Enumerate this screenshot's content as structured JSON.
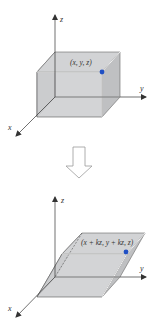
{
  "figure": {
    "top_diagram": {
      "title": "Original box",
      "axes": {
        "x_label": "x",
        "y_label": "y",
        "z_label": "z"
      },
      "point_label": "(x, y, z)",
      "point_color": "#1f4fc4"
    },
    "transition_arrow": {
      "direction": "down",
      "style": "outline"
    },
    "bottom_diagram": {
      "title": "Sheared box",
      "axes": {
        "x_label": "x",
        "y_label": "y",
        "z_label": "z"
      },
      "point_label": "(x + kz, y + kz, z)",
      "point_color": "#1f4fc4"
    },
    "colors": {
      "face_fill": "#c9cacc",
      "face_fill_light": "#d6d7d9",
      "edge": "#555555",
      "highlight_edge": "#ffffff",
      "axis": "#333333",
      "point": "#1f4fc4",
      "arrow_outline": "#999999"
    }
  }
}
